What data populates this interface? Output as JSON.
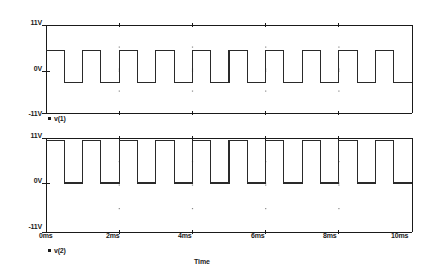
{
  "figure": {
    "background": "#ffffff",
    "line_color": "#2a2a2a",
    "axis_color": "#1a1a1a",
    "grid_dot_color": "#8a8a8a"
  },
  "axis_title": "Time",
  "panels": [
    {
      "id": "panel-v1",
      "trace_name": "v(1)",
      "y_ticks": [
        "11V",
        "0V",
        "-11V"
      ],
      "y_tick_values": [
        11,
        0,
        -11
      ],
      "ylim": [
        -11,
        11
      ],
      "x_ticks": [],
      "show_x_labels": false
    },
    {
      "id": "panel-v2",
      "trace_name": "v(2)",
      "y_ticks": [
        "11V",
        "0V",
        "-11V"
      ],
      "y_tick_values": [
        11,
        0,
        -11
      ],
      "ylim": [
        -11,
        11
      ],
      "x_ticks": [
        "0ms",
        "2ms",
        "4ms",
        "6ms",
        "8ms",
        "10ms"
      ],
      "show_x_labels": true
    }
  ],
  "chart_data": {
    "type": "line",
    "title": "",
    "subtitle": "",
    "xlabel": "Time",
    "ylabel": "",
    "grid": true,
    "legend_position": "below-axes-left",
    "xlim": [
      0,
      10
    ],
    "x_unit": "ms",
    "x_tick_values": [
      0,
      2,
      4,
      6,
      8,
      10
    ],
    "x_tick_labels": [
      "0ms",
      "2ms",
      "4ms",
      "6ms",
      "8ms",
      "10ms"
    ],
    "panels": [
      {
        "name": "v(1)",
        "ylim": [
          -11,
          11
        ],
        "y_tick_values": [
          11,
          0,
          -11
        ],
        "y_tick_labels": [
          "11V",
          "0V",
          "-11V"
        ],
        "waveform": "square",
        "period_ms": 1.0,
        "frequency_khz": 1.0,
        "duty_cycle": 0.5,
        "high_level_v": 5.0,
        "low_level_v": -3.0,
        "initial_state": "high",
        "cycles": 10,
        "points": [
          [
            0.0,
            5.0
          ],
          [
            0.5,
            5.0
          ],
          [
            0.5,
            -3.0
          ],
          [
            1.0,
            -3.0
          ],
          [
            1.0,
            5.0
          ],
          [
            1.5,
            5.0
          ],
          [
            1.5,
            -3.0
          ],
          [
            2.0,
            -3.0
          ],
          [
            2.0,
            5.0
          ],
          [
            2.5,
            5.0
          ],
          [
            2.5,
            -3.0
          ],
          [
            3.0,
            -3.0
          ],
          [
            3.0,
            5.0
          ],
          [
            3.5,
            5.0
          ],
          [
            3.5,
            -3.0
          ],
          [
            4.0,
            -3.0
          ],
          [
            4.0,
            5.0
          ],
          [
            4.5,
            5.0
          ],
          [
            4.5,
            -3.0
          ],
          [
            5.0,
            -3.0
          ],
          [
            5.0,
            5.0
          ],
          [
            5.5,
            5.0
          ],
          [
            5.5,
            -3.0
          ],
          [
            6.0,
            -3.0
          ],
          [
            6.0,
            5.0
          ],
          [
            6.5,
            5.0
          ],
          [
            6.5,
            -3.0
          ],
          [
            7.0,
            -3.0
          ],
          [
            7.0,
            5.0
          ],
          [
            7.5,
            5.0
          ],
          [
            7.5,
            -3.0
          ],
          [
            8.0,
            -3.0
          ],
          [
            8.0,
            5.0
          ],
          [
            8.5,
            5.0
          ],
          [
            8.5,
            -3.0
          ],
          [
            9.0,
            -3.0
          ],
          [
            9.0,
            5.0
          ],
          [
            9.5,
            5.0
          ],
          [
            9.5,
            -3.0
          ],
          [
            10.0,
            -3.0
          ]
        ]
      },
      {
        "name": "v(2)",
        "ylim": [
          -11,
          11
        ],
        "y_tick_values": [
          11,
          0,
          -11
        ],
        "y_tick_labels": [
          "11V",
          "0V",
          "-11V"
        ],
        "waveform": "square",
        "period_ms": 1.0,
        "frequency_khz": 1.0,
        "duty_cycle": 0.5,
        "high_level_v": 10.3,
        "low_level_v": 0.0,
        "initial_state": "high",
        "cycles": 10,
        "points": [
          [
            0.0,
            10.3
          ],
          [
            0.5,
            10.3
          ],
          [
            0.5,
            0.0
          ],
          [
            1.0,
            0.0
          ],
          [
            1.0,
            10.3
          ],
          [
            1.5,
            10.3
          ],
          [
            1.5,
            0.0
          ],
          [
            2.0,
            0.0
          ],
          [
            2.0,
            10.3
          ],
          [
            2.5,
            10.3
          ],
          [
            2.5,
            0.0
          ],
          [
            3.0,
            0.0
          ],
          [
            3.0,
            10.3
          ],
          [
            3.5,
            10.3
          ],
          [
            3.5,
            0.0
          ],
          [
            4.0,
            0.0
          ],
          [
            4.0,
            10.3
          ],
          [
            4.5,
            10.3
          ],
          [
            4.5,
            0.0
          ],
          [
            5.0,
            0.0
          ],
          [
            5.0,
            10.3
          ],
          [
            5.5,
            10.3
          ],
          [
            5.5,
            0.0
          ],
          [
            6.0,
            0.0
          ],
          [
            6.0,
            10.3
          ],
          [
            6.5,
            10.3
          ],
          [
            6.5,
            0.0
          ],
          [
            7.0,
            0.0
          ],
          [
            7.0,
            10.3
          ],
          [
            7.5,
            10.3
          ],
          [
            7.5,
            0.0
          ],
          [
            8.0,
            0.0
          ],
          [
            8.0,
            10.3
          ],
          [
            8.5,
            10.3
          ],
          [
            8.5,
            0.0
          ],
          [
            9.0,
            0.0
          ],
          [
            9.0,
            10.3
          ],
          [
            9.5,
            10.3
          ],
          [
            9.5,
            0.0
          ],
          [
            10.0,
            0.0
          ]
        ]
      }
    ]
  }
}
